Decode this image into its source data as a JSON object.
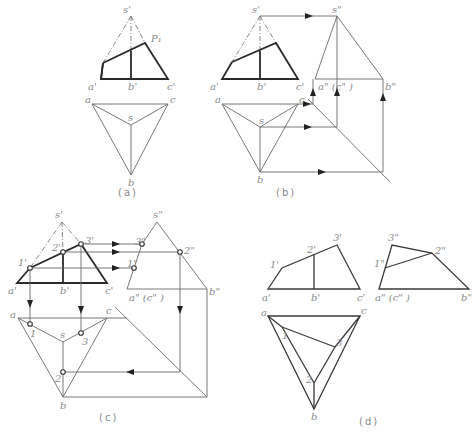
{
  "figure": {
    "panels": [
      {
        "id": "a",
        "caption": "(a)",
        "front_labels": {
          "apex": "s'",
          "a": "a'",
          "b": "b'",
          "c": "c'",
          "plane": "P₁"
        },
        "top_labels": {
          "a": "a",
          "b": "b",
          "c": "c",
          "s": "s"
        }
      },
      {
        "id": "b",
        "caption": "(b)",
        "front_labels": {
          "apex": "s'",
          "a": "a'",
          "b": "b'",
          "c": "c'"
        },
        "side_labels": {
          "apex": "s\"",
          "ac": "a\" (c\" )",
          "b": "b\""
        },
        "top_labels": {
          "a": "a",
          "b": "b",
          "c": "c",
          "s": "s"
        }
      },
      {
        "id": "c",
        "caption": "(c)",
        "front_labels": {
          "apex": "s'",
          "a": "a'",
          "b": "b'",
          "c": "c'",
          "p1": "1'",
          "p2": "2'",
          "p3": "3'"
        },
        "side_labels": {
          "apex": "s\"",
          "ac": "a\" (c\" )",
          "b": "b\"",
          "p1": "1\"",
          "p2": "2\"",
          "p3": "3\""
        },
        "top_labels": {
          "a": "a",
          "b": "b",
          "c": "c",
          "s": "s",
          "p1": "1",
          "p2": "2",
          "p3": "3"
        }
      },
      {
        "id": "d",
        "caption": "(d)",
        "front_labels": {
          "a": "a'",
          "b": "b'",
          "c": "c'",
          "p1": "1'",
          "p2": "2'",
          "p3": "3'"
        },
        "side_labels": {
          "ac": "a\" (c\" )",
          "b": "b\"",
          "p1": "1\"",
          "p2": "2\"",
          "p3": "3\""
        },
        "top_labels": {
          "a": "a",
          "b": "b",
          "c": "c",
          "p1": "1",
          "p2": "2",
          "p3": "3"
        }
      }
    ]
  }
}
